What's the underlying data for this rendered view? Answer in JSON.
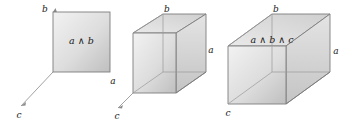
{
  "figure": {
    "background_color": "#ffffff",
    "stroke_color": "#6e6e6e",
    "label_color": "#1a1a1a",
    "fill_light": "#efefef",
    "fill_mid": "#d9d9d9",
    "fill_dark": "#b9b9b9"
  },
  "panels": [
    {
      "name": "square-a-and-b",
      "face_label": "a ∧ b",
      "face_label_parts": {
        "left": "a",
        "op": "∧",
        "right": "b"
      },
      "axes": [
        {
          "name": "b",
          "label": "b",
          "position": "top-left"
        },
        {
          "name": "a",
          "label": "a",
          "position": "bottom-right"
        },
        {
          "name": "c",
          "label": "c",
          "position": "lower-left-diagonal"
        }
      ]
    },
    {
      "name": "cube",
      "face_label": "",
      "axes": [
        {
          "name": "b",
          "label": "b",
          "position": "top"
        },
        {
          "name": "a",
          "label": "a",
          "position": "right"
        },
        {
          "name": "c",
          "label": "c",
          "position": "lower-left-diagonal"
        }
      ]
    },
    {
      "name": "cuboid-a-and-b-and-c",
      "face_label": "a ∧ b ∧ c",
      "face_label_parts": {
        "p1": "a",
        "op1": "∧",
        "p2": "b",
        "op2": "∧",
        "p3": "c"
      },
      "axes": [
        {
          "name": "b",
          "label": "b",
          "position": "top"
        },
        {
          "name": "a",
          "label": "a",
          "position": "right"
        },
        {
          "name": "c",
          "label": "c",
          "position": "bottom-left"
        }
      ]
    }
  ],
  "labels": {
    "a": "a",
    "b": "b",
    "c": "c",
    "wedge": "∧",
    "a_and_b": "a ∧ b",
    "a_and_b_and_c": "a ∧ b ∧ c"
  }
}
